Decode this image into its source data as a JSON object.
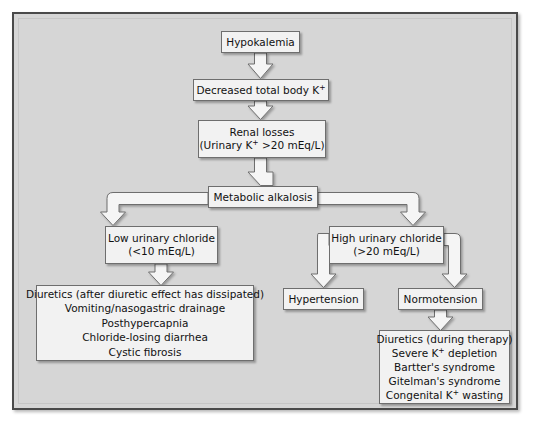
{
  "figure": {
    "type": "flowchart",
    "panel_background": "#d6d6d6",
    "node_background": "#f2f2f2",
    "border_color": "#4a4a4a"
  },
  "nodes": {
    "hypokalemia": {
      "text": "Hypokalemia"
    },
    "decreased_total_body_k": {
      "pre": "Decreased total body K",
      "sup": "+",
      "post": ""
    },
    "renal_losses": {
      "line1": "Renal losses",
      "line2_pre": "(Urinary K",
      "line2_sup": "+",
      "line2_post": " >20 mEq/L)"
    },
    "metabolic_alkalosis": {
      "text": "Metabolic alkalosis"
    },
    "low_urinary_chloride": {
      "line1": "Low urinary chloride",
      "line2": "(<10 mEq/L)"
    },
    "high_urinary_chloride": {
      "line1": "High urinary chloride",
      "line2": "(>20 mEq/L)"
    },
    "hypertension": {
      "text": "Hypertension"
    },
    "normotension": {
      "text": "Normotension"
    },
    "low_chloride_causes": {
      "items": [
        "Diuretics (after diuretic effect has dissipated)",
        "Vomiting/nasogastric drainage",
        "Posthypercapnia",
        "Chloride-losing diarrhea",
        "Cystic fibrosis"
      ]
    },
    "normotension_causes": {
      "item1": "Diuretics (during therapy)",
      "item2_pre": "Severe K",
      "item2_sup": "+",
      "item2_post": " depletion",
      "item3": "Bartter's syndrome",
      "item4": "Gitelman's syndrome",
      "item5_pre": "Congenital K",
      "item5_sup": "+",
      "item5_post": " wasting"
    }
  },
  "edges": [
    {
      "from": "hypokalemia",
      "to": "decreased_total_body_k",
      "style": "block-arrow-down"
    },
    {
      "from": "decreased_total_body_k",
      "to": "renal_losses",
      "style": "block-arrow-down"
    },
    {
      "from": "renal_losses",
      "to": "metabolic_alkalosis",
      "style": "block-arrow-down"
    },
    {
      "from": "metabolic_alkalosis",
      "to": "low_urinary_chloride",
      "style": "block-arrow-elbow-left"
    },
    {
      "from": "metabolic_alkalosis",
      "to": "high_urinary_chloride",
      "style": "block-arrow-elbow-right"
    },
    {
      "from": "low_urinary_chloride",
      "to": "low_chloride_causes",
      "style": "block-arrow-down"
    },
    {
      "from": "high_urinary_chloride",
      "to": "hypertension",
      "style": "block-arrow-elbow-left"
    },
    {
      "from": "high_urinary_chloride",
      "to": "normotension",
      "style": "block-arrow-elbow-right"
    },
    {
      "from": "normotension",
      "to": "normotension_causes",
      "style": "block-arrow-down"
    }
  ]
}
